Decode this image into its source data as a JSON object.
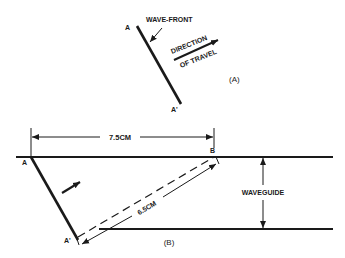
{
  "figure_a": {
    "point_top": "A",
    "point_bottom": "A'",
    "wavefront_label": "WAVE-FRONT",
    "direction_line1": "DIRECTION",
    "direction_line2": "OF TRAVEL",
    "caption": "(A)"
  },
  "figure_b": {
    "point_a": "A",
    "point_a_prime": "A'",
    "point_b": "B",
    "horizontal_dimension": "7.5CM",
    "diagonal_dimension": "6.5CM",
    "waveguide_label": "WAVEGUIDE",
    "caption": "(B)"
  },
  "colors": {
    "ink": "#1a1a1a",
    "background": "#ffffff"
  }
}
